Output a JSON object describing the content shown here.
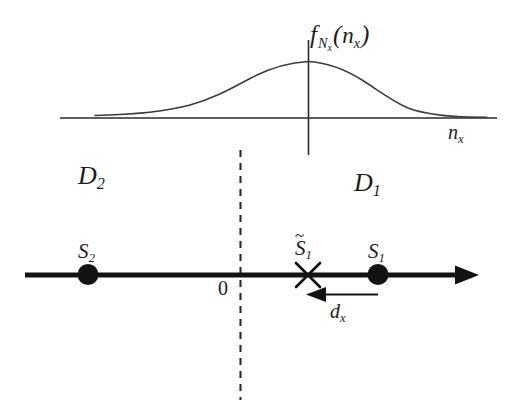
{
  "figure": {
    "background_color": "#ffffff",
    "line_color": "#1c1c1c"
  },
  "density_plot": {
    "function_label": {
      "f": "f",
      "subscript": "N",
      "sub_subscript": "x",
      "open_paren": "(",
      "argument": "n",
      "argument_subscript": "x",
      "close_paren": ")"
    },
    "axis_label": {
      "symbol": "n",
      "subscript": "x"
    },
    "axis_y": 118,
    "axis_x_start": 60,
    "axis_x_end": 497,
    "peak_x": 308,
    "peak_y": 62,
    "vertical_line_top": 40,
    "vertical_line_bottom": 155,
    "curve_shape": "gaussian-bell",
    "curve_color": "#3a3a3a"
  },
  "decision_regions": [
    {
      "name": "region-d2",
      "symbol": "D",
      "subscript": "2",
      "side": "left"
    },
    {
      "name": "region-d1",
      "symbol": "D",
      "subscript": "1",
      "side": "right"
    }
  ],
  "signal_axis": {
    "y": 275,
    "x_start": 25,
    "x_end": 470,
    "arrow_direction": "right",
    "stroke_width": 5,
    "origin_label": "0",
    "origin_x": 240
  },
  "signal_points": [
    {
      "name": "signal-s2",
      "symbol": "S",
      "subscript": "2",
      "marker": "filled-circle",
      "x": 88
    },
    {
      "name": "signal-s1-tilde",
      "symbol": "S",
      "subscript": "1",
      "accent": "tilde",
      "accent_glyph": "~",
      "marker": "x-cross",
      "x": 308
    },
    {
      "name": "signal-s1",
      "symbol": "S",
      "subscript": "1",
      "marker": "filled-circle",
      "x": 378
    }
  ],
  "boundary": {
    "name": "decision-boundary",
    "style": "dashed",
    "x": 240,
    "y_top": 150,
    "y_bottom": 400
  },
  "displacement": {
    "symbol": "d",
    "subscript": "x",
    "arrow_direction": "left",
    "from_x": 378,
    "to_x": 306,
    "y": 294
  }
}
